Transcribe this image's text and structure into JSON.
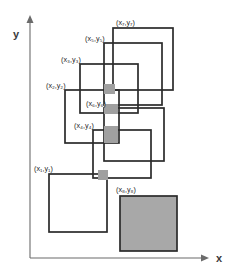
{
  "figure": {
    "width": 232,
    "height": 275,
    "background": "#ffffff"
  },
  "colors": {
    "axis": "#6b6b6b",
    "rect_stroke": "#2b2b2b",
    "shaded_fill": "#a8a8a8",
    "overlap_fill": "#a0a0a0",
    "label_text": "#262626",
    "axis_label_text": "#3a3a3a"
  },
  "axes": {
    "y_label": "y",
    "x_label": "x",
    "origin": {
      "x": 30,
      "y": 258
    },
    "y_axis_top": 17,
    "x_axis_right": 207
  },
  "point_labels": [
    {
      "id": "p7",
      "text": "(x₇,y₇)",
      "x": 116,
      "y": 25
    },
    {
      "id": "p5",
      "text": "(x₅,y₅)",
      "x": 85,
      "y": 41
    },
    {
      "id": "p3",
      "text": "(x₃,y₃)",
      "x": 61,
      "y": 62
    },
    {
      "id": "p2",
      "text": "(x₂,y₂)",
      "x": 46,
      "y": 88
    },
    {
      "id": "p6",
      "text": "(x₆,y₆)",
      "x": 86,
      "y": 106
    },
    {
      "id": "p4",
      "text": "(x₄,y₄)",
      "x": 74,
      "y": 128
    },
    {
      "id": "p1",
      "text": "(x₁,y₁)",
      "x": 34,
      "y": 171
    },
    {
      "id": "p8",
      "text": "(x₈,y₈)",
      "x": 116,
      "y": 192
    }
  ],
  "rectangles": [
    {
      "id": "r7",
      "label": "(x₇,y₇)",
      "x": 113,
      "y": 28,
      "w": 60,
      "h": 62,
      "filled": false
    },
    {
      "id": "r5",
      "label": "(x₅,y₅)",
      "x": 104,
      "y": 43,
      "w": 58,
      "h": 62,
      "filled": false
    },
    {
      "id": "r3",
      "label": "(x₃,y₃)",
      "x": 80,
      "y": 64,
      "w": 58,
      "h": 49,
      "filled": false
    },
    {
      "id": "r2",
      "label": "(x₂,y₂)",
      "x": 65,
      "y": 90,
      "w": 54,
      "h": 53,
      "filled": false
    },
    {
      "id": "r6",
      "label": "(x₆,y₆)",
      "x": 104,
      "y": 108,
      "w": 60,
      "h": 53,
      "filled": false
    },
    {
      "id": "r4",
      "label": "(x₄,y₄)",
      "x": 93,
      "y": 130,
      "w": 58,
      "h": 48,
      "filled": false
    },
    {
      "id": "r1",
      "label": "(x₁,y₁)",
      "x": 49,
      "y": 174,
      "w": 58,
      "h": 58,
      "filled": false
    },
    {
      "id": "r8",
      "label": "(x₈,y₈)",
      "x": 120,
      "y": 196,
      "w": 57,
      "h": 55,
      "filled": true
    }
  ],
  "overlap_cells": [
    {
      "id": "o1",
      "x": 104,
      "y": 84,
      "w": 11,
      "h": 10
    },
    {
      "id": "o2",
      "x": 104,
      "y": 104,
      "w": 14,
      "h": 10
    },
    {
      "id": "o3",
      "x": 104,
      "y": 126,
      "w": 14,
      "h": 17
    },
    {
      "id": "o4",
      "x": 98,
      "y": 170,
      "w": 10,
      "h": 10
    }
  ]
}
